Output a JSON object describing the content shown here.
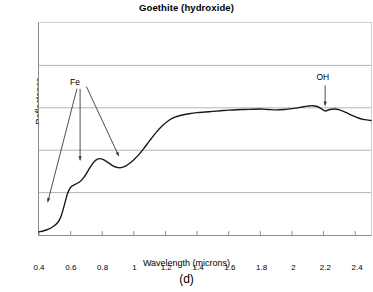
{
  "figure": {
    "caption": "(d)"
  },
  "chart_data": {
    "type": "line",
    "title": "Goethite (hydroxide)",
    "xlabel": "Wavelength (microns)",
    "ylabel": "Reflectance",
    "xlim": [
      0.4,
      2.5
    ],
    "ylim": [
      0,
      1
    ],
    "grid": "horizontal",
    "legend": "none",
    "xticks": [
      0.4,
      0.6,
      0.8,
      1,
      1.2,
      1.4,
      1.6,
      1.8,
      2,
      2.2,
      2.4
    ],
    "xtick_labels": [
      "0.4",
      "0.6",
      "0.8",
      "1",
      "1.2",
      "1.4",
      "1.6",
      "1.8",
      "2",
      "2.2",
      "2.4"
    ],
    "yticks": [
      0,
      0.2,
      0.4,
      0.6,
      0.8,
      1
    ],
    "ytick_labels": [
      "0",
      "0.2",
      "0.4",
      "0.6",
      "0.8",
      "1"
    ],
    "series": [
      {
        "name": "Goethite reflectance spectrum",
        "color": "#1a1a1a",
        "x": [
          0.4,
          0.43,
          0.46,
          0.49,
          0.52,
          0.54,
          0.56,
          0.58,
          0.6,
          0.62,
          0.64,
          0.66,
          0.68,
          0.7,
          0.72,
          0.74,
          0.76,
          0.78,
          0.8,
          0.82,
          0.84,
          0.86,
          0.88,
          0.9,
          0.92,
          0.95,
          0.98,
          1.0,
          1.03,
          1.06,
          1.1,
          1.14,
          1.18,
          1.22,
          1.26,
          1.3,
          1.35,
          1.4,
          1.45,
          1.5,
          1.55,
          1.6,
          1.65,
          1.7,
          1.75,
          1.8,
          1.85,
          1.9,
          1.95,
          2.0,
          2.05,
          2.1,
          2.13,
          2.16,
          2.19,
          2.21,
          2.24,
          2.27,
          2.3,
          2.34,
          2.38,
          2.42,
          2.46,
          2.5
        ],
        "y": [
          0.015,
          0.02,
          0.028,
          0.04,
          0.06,
          0.09,
          0.14,
          0.195,
          0.225,
          0.235,
          0.243,
          0.252,
          0.268,
          0.29,
          0.315,
          0.338,
          0.353,
          0.36,
          0.358,
          0.35,
          0.34,
          0.33,
          0.322,
          0.318,
          0.318,
          0.326,
          0.342,
          0.355,
          0.378,
          0.405,
          0.445,
          0.483,
          0.515,
          0.54,
          0.556,
          0.565,
          0.572,
          0.577,
          0.58,
          0.583,
          0.586,
          0.589,
          0.591,
          0.592,
          0.593,
          0.594,
          0.592,
          0.59,
          0.592,
          0.596,
          0.602,
          0.608,
          0.61,
          0.606,
          0.594,
          0.585,
          0.592,
          0.594,
          0.59,
          0.578,
          0.564,
          0.552,
          0.544,
          0.54
        ]
      }
    ],
    "annotations": [
      {
        "label": "Fe",
        "label_x": 0.645,
        "label_y": 0.718,
        "arrows": [
          {
            "from_x": 0.64,
            "from_y": 0.69,
            "to_x": 0.455,
            "to_y": 0.155
          },
          {
            "from_x": 0.66,
            "from_y": 0.69,
            "to_x": 0.66,
            "to_y": 0.352
          },
          {
            "from_x": 0.7,
            "from_y": 0.7,
            "to_x": 0.905,
            "to_y": 0.372
          }
        ]
      },
      {
        "label": "OH",
        "label_x": 2.195,
        "label_y": 0.742,
        "arrows": [
          {
            "from_x": 2.21,
            "from_y": 0.705,
            "to_x": 2.21,
            "to_y": 0.61
          }
        ]
      }
    ]
  }
}
